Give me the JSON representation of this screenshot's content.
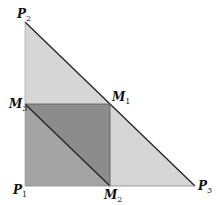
{
  "diagram": {
    "type": "geometry",
    "colors": {
      "outer_triangle": "#d6d6d6",
      "square_lower": "#a4a4a4",
      "square_upper": "#8c8c8c",
      "stroke": "#222222",
      "background": "#ffffff"
    },
    "points": [
      {
        "id": "P1",
        "letter": "P",
        "sub": "1",
        "x": 25,
        "y": 186
      },
      {
        "id": "P2",
        "letter": "P",
        "sub": "2",
        "x": 25,
        "y": 22
      },
      {
        "id": "P3",
        "letter": "P",
        "sub": "3",
        "x": 195,
        "y": 186
      },
      {
        "id": "M1",
        "letter": "M",
        "sub": "1",
        "x": 110,
        "y": 104
      },
      {
        "id": "M2",
        "letter": "M",
        "sub": "2",
        "x": 110,
        "y": 186
      },
      {
        "id": "M3",
        "letter": "M",
        "sub": "3",
        "x": 25,
        "y": 104
      }
    ],
    "labels": {
      "P1": {
        "letter": "P",
        "sub": "1"
      },
      "P2": {
        "letter": "P",
        "sub": "2"
      },
      "P3": {
        "letter": "P",
        "sub": "3"
      },
      "M1": {
        "letter": "M",
        "sub": "1"
      },
      "M2": {
        "letter": "M",
        "sub": "2"
      },
      "M3": {
        "letter": "M",
        "sub": "3"
      }
    },
    "segments": [
      [
        "P2",
        "P3"
      ],
      [
        "M3",
        "M2"
      ],
      [
        "M3",
        "M1"
      ],
      [
        "M1",
        "M2"
      ],
      [
        "P1",
        "P3"
      ],
      [
        "P1",
        "P2"
      ]
    ]
  }
}
